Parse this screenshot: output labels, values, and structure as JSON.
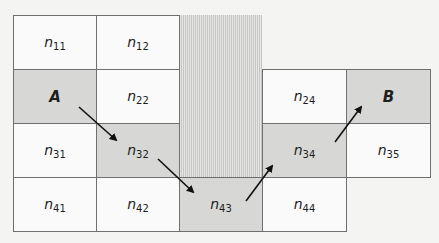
{
  "diagram": {
    "type": "grid-path",
    "colors": {
      "shaded_cell": "#d7d7d5",
      "white_cell": "#fafafa",
      "grid_line": "#6f6f6f",
      "obstacle_hatch": "#c6c6c4",
      "arrow": "#111111"
    },
    "cells": [
      {
        "id": "n11",
        "base": "n",
        "sub": "11",
        "row": 1,
        "col": 1,
        "shaded": false
      },
      {
        "id": "n12",
        "base": "n",
        "sub": "12",
        "row": 1,
        "col": 2,
        "shaded": false
      },
      {
        "id": "A",
        "base": "A",
        "sub": "",
        "row": 2,
        "col": 1,
        "shaded": true,
        "bold": true
      },
      {
        "id": "n22",
        "base": "n",
        "sub": "22",
        "row": 2,
        "col": 2,
        "shaded": false
      },
      {
        "id": "n24",
        "base": "n",
        "sub": "24",
        "row": 2,
        "col": 4,
        "shaded": false
      },
      {
        "id": "B",
        "base": "B",
        "sub": "",
        "row": 2,
        "col": 5,
        "shaded": true,
        "bold": true
      },
      {
        "id": "n31",
        "base": "n",
        "sub": "31",
        "row": 3,
        "col": 1,
        "shaded": false
      },
      {
        "id": "n32",
        "base": "n",
        "sub": "32",
        "row": 3,
        "col": 2,
        "shaded": true
      },
      {
        "id": "n34",
        "base": "n",
        "sub": "34",
        "row": 3,
        "col": 4,
        "shaded": true
      },
      {
        "id": "n35",
        "base": "n",
        "sub": "35",
        "row": 3,
        "col": 5,
        "shaded": false
      },
      {
        "id": "n41",
        "base": "n",
        "sub": "41",
        "row": 4,
        "col": 1,
        "shaded": false
      },
      {
        "id": "n42",
        "base": "n",
        "sub": "42",
        "row": 4,
        "col": 2,
        "shaded": false
      },
      {
        "id": "n43",
        "base": "n",
        "sub": "43",
        "row": 4,
        "col": 3,
        "shaded": true
      },
      {
        "id": "n44",
        "base": "n",
        "sub": "44",
        "row": 4,
        "col": 4,
        "shaded": false
      }
    ],
    "obstacle": {
      "col": 3,
      "rows": [
        1,
        2,
        3
      ],
      "pattern": "vertical-hatch"
    },
    "path": [
      "A",
      "n32",
      "n43",
      "n34",
      "B"
    ],
    "arrows": [
      {
        "from": "A",
        "to": "n32",
        "x1": 79,
        "y1": 107,
        "x2": 116,
        "y2": 140
      },
      {
        "from": "n32",
        "to": "n43",
        "x1": 158,
        "y1": 159,
        "x2": 193,
        "y2": 192
      },
      {
        "from": "n43",
        "to": "n34",
        "x1": 246,
        "y1": 201,
        "x2": 272,
        "y2": 166
      },
      {
        "from": "n34",
        "to": "B",
        "x1": 335,
        "y1": 142,
        "x2": 361,
        "y2": 107
      }
    ]
  }
}
